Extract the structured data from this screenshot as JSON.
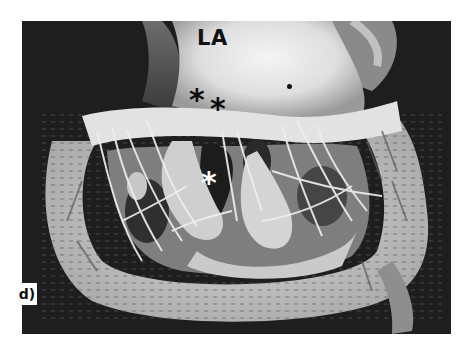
{
  "figure": {
    "labels": {
      "chamber": "LA",
      "asterisk_black_1": "*",
      "asterisk_black_2": "*",
      "asterisk_white": "*",
      "panel": "d)"
    },
    "colors": {
      "background": "#1e1e1e",
      "tissue_light": "#e8e8e8",
      "tissue_mid": "#b5b5b5",
      "cavity_dark": "#2a2a2a",
      "border": "#ffffff"
    }
  }
}
